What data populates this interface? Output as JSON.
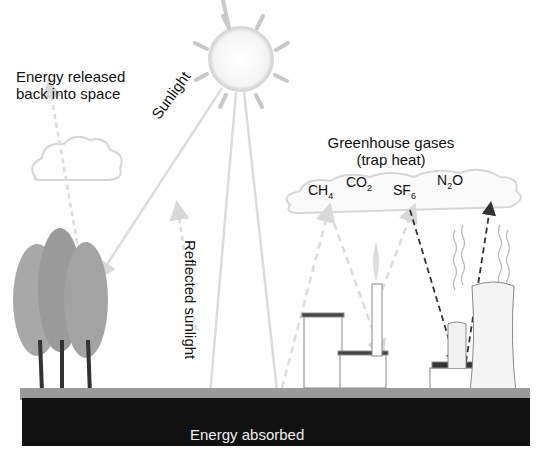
{
  "diagram": {
    "labels": {
      "energy_released": [
        "Energy released",
        "back into space"
      ],
      "sunlight": "Sunlight",
      "reflected_sunlight": "Reflected sunlight",
      "greenhouse_gases": [
        "Greenhouse gases",
        "(trap heat)"
      ],
      "energy_absorbed": "Energy absorbed"
    },
    "gases": [
      {
        "base": "CH",
        "sub": "4",
        "tail": ""
      },
      {
        "base": "CO",
        "sub": "2",
        "tail": ""
      },
      {
        "base": "SF",
        "sub": "6",
        "tail": ""
      },
      {
        "base": "N",
        "sub": "2",
        "tail": "O"
      }
    ],
    "colors": {
      "light_arrow": "#dcdcdc",
      "dark_arrow": "#333333",
      "ground": "#111111",
      "grass": "#999999",
      "tree": "#9a9a9a"
    }
  }
}
